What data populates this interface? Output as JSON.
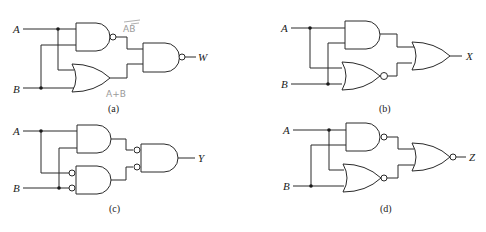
{
  "diagrams": {
    "a": {
      "caption": "(a)",
      "input_a": "A",
      "input_b": "B",
      "output": "W",
      "annotation_top": "AB",
      "annotation_bottom": "A+B"
    },
    "b": {
      "caption": "(b)",
      "input_a": "A",
      "input_b": "B",
      "output": "X"
    },
    "c": {
      "caption": "(c)",
      "input_a": "A",
      "input_b": "B",
      "output": "Y"
    },
    "d": {
      "caption": "(d)",
      "input_a": "A",
      "input_b": "B",
      "output": "Z"
    }
  },
  "colors": {
    "line": "#2a2a2a",
    "annotation": "#9a9a9a",
    "background": "#ffffff"
  }
}
